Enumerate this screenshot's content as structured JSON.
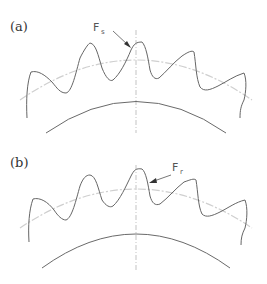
{
  "figure": {
    "panels": [
      {
        "label": "(a)",
        "force_label": "F",
        "force_subscript": "s",
        "description": "Gear teeth profile with pitch circle, root circle and arrow pointing to tooth tip flank"
      },
      {
        "label": "(b)",
        "force_label": "F",
        "force_subscript": "r",
        "description": "Gear teeth profile with pitch circle, root circle and arrow pointing to right flank of tooth"
      }
    ],
    "colors": {
      "profile": "#666666",
      "pitch_circle": "#cfcfcf",
      "centerline": "#9a9a9a",
      "text": "#333333"
    }
  }
}
